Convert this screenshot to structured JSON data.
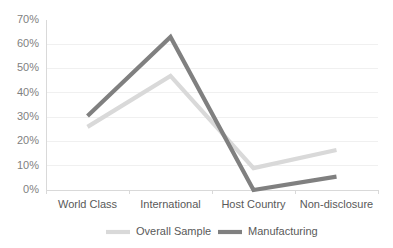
{
  "chart_data": {
    "type": "line",
    "title": "",
    "subtitle": "",
    "xlabel": "",
    "ylabel": "",
    "categories": [
      "World Class",
      "International",
      "Host Country",
      "Non-disclosure"
    ],
    "series": [
      {
        "name": "Overall Sample",
        "color": "#d9d9d9",
        "values": [
          26,
          47,
          9,
          16.5
        ]
      },
      {
        "name": "Manufacturing",
        "color": "#808080",
        "values": [
          30.5,
          63,
          0,
          5.5
        ]
      }
    ],
    "ylim": [
      0,
      70
    ],
    "ytick_values": [
      0,
      10,
      20,
      30,
      40,
      50,
      60,
      70
    ],
    "ytick_labels": [
      "0%",
      "10%",
      "20%",
      "30%",
      "40%",
      "50%",
      "60%",
      "70%"
    ],
    "grid": true,
    "grid_axis": "y",
    "legend_position": "bottom",
    "colors": {
      "gridline": "#f0f0f0",
      "axis": "#d9d9d9",
      "tick_text": "#7f7f7f",
      "label_text": "#595959",
      "background": "#ffffff"
    }
  },
  "axes": {
    "y_ticks": [
      {
        "label": "70%",
        "value": 70
      },
      {
        "label": "60%",
        "value": 60
      },
      {
        "label": "50%",
        "value": 50
      },
      {
        "label": "40%",
        "value": 40
      },
      {
        "label": "30%",
        "value": 30
      },
      {
        "label": "20%",
        "value": 20
      },
      {
        "label": "10%",
        "value": 10
      },
      {
        "label": "0%",
        "value": 0
      }
    ],
    "x_ticks": [
      {
        "label": "World Class"
      },
      {
        "label": "International"
      },
      {
        "label": "Host Country"
      },
      {
        "label": "Non-disclosure"
      }
    ]
  },
  "legend": {
    "items": [
      {
        "label": "Overall Sample",
        "color": "#d9d9d9"
      },
      {
        "label": "Manufacturing",
        "color": "#808080"
      }
    ]
  }
}
